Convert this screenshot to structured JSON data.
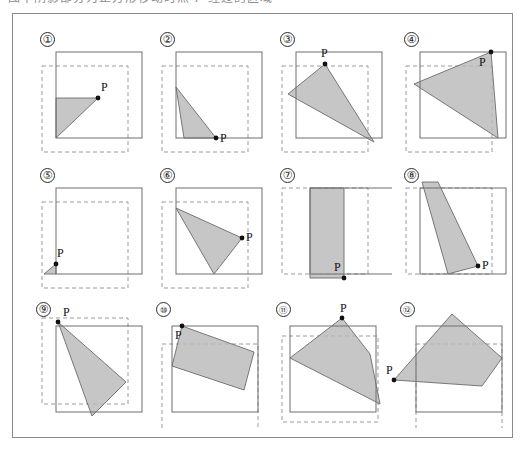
{
  "figure": {
    "caption_top": "图中阴影部分为正方形移动时点 P 经过的区域",
    "point_label": "P",
    "colors": {
      "plate_border": "#8a8a8a",
      "square_solid": "#6e6e6e",
      "square_dashed": "#9a9a9a",
      "shade_fill": "#b9b9b9",
      "shade_stroke": "#6b6b6b",
      "dot": "#111111",
      "label_text": "#111111"
    },
    "grid": {
      "rows": 3,
      "cols": 4,
      "count": 12
    }
  },
  "panels": [
    {
      "id": 1,
      "number": "①",
      "num_pos": [
        18,
        8
      ],
      "solid_square": [
        34,
        28,
        86,
        86
      ],
      "dashed_square": [
        20,
        42,
        86,
        86
      ],
      "shape_type": "triangle",
      "points": "34,74 76,74 34,114",
      "point_p": [
        76,
        74
      ],
      "p_label_pos": [
        79,
        57
      ]
    },
    {
      "id": 2,
      "number": "②",
      "num_pos": [
        18,
        8
      ],
      "solid_square": [
        34,
        28,
        86,
        86
      ],
      "dashed_square": [
        20,
        42,
        86,
        86
      ],
      "shape_type": "triangle",
      "points": "34,63 74,114 42,114",
      "point_p": [
        74,
        114
      ],
      "p_label_pos": [
        78,
        108
      ]
    },
    {
      "id": 3,
      "number": "③",
      "num_pos": [
        18,
        8
      ],
      "solid_square": [
        34,
        28,
        86,
        86
      ],
      "dashed_square": [
        20,
        42,
        86,
        86
      ],
      "shape_type": "triangle",
      "points": "63,40 26,70 112,118",
      "point_p": [
        63,
        40
      ],
      "p_label_pos": [
        59,
        23
      ]
    },
    {
      "id": 4,
      "number": "④",
      "num_pos": [
        18,
        8
      ],
      "solid_square": [
        34,
        28,
        86,
        86
      ],
      "dashed_square": [
        20,
        42,
        86,
        86
      ],
      "shape_type": "triangle",
      "points": "105,28 28,60 112,114",
      "point_p": [
        105,
        28
      ],
      "p_label_pos": [
        93,
        32
      ]
    },
    {
      "id": 5,
      "number": "⑤",
      "num_pos": [
        18,
        8
      ],
      "solid_square": [
        34,
        28,
        86,
        86
      ],
      "dashed_square": [
        20,
        42,
        86,
        86
      ],
      "shape_type": "triangle",
      "points": "34,104 34,114 22,114",
      "point_p": [
        34,
        104
      ],
      "p_label_pos": [
        35,
        87
      ]
    },
    {
      "id": 6,
      "number": "⑥",
      "num_pos": [
        18,
        8
      ],
      "solid_square": [
        34,
        28,
        86,
        86
      ],
      "dashed_square": [
        20,
        42,
        86,
        86
      ],
      "shape_type": "triangle",
      "points": "34,48 100,78 72,114",
      "point_p": [
        100,
        78
      ],
      "p_label_pos": [
        104,
        71
      ]
    },
    {
      "id": 7,
      "number": "⑦",
      "num_pos": [
        18,
        8
      ],
      "solid_square": [
        48,
        28,
        86,
        86
      ],
      "dashed_square": [
        20,
        28,
        86,
        86
      ],
      "shape_type": "band",
      "points": "48,28 82,28 82,118 48,118",
      "point_p": [
        82,
        118
      ],
      "p_label_pos": [
        72,
        101
      ]
    },
    {
      "id": 8,
      "number": "⑧",
      "num_pos": [
        18,
        8
      ],
      "solid_square": [
        34,
        28,
        86,
        86
      ],
      "dashed_square": [
        20,
        28,
        86,
        86
      ],
      "shape_type": "quad",
      "points": "36,22 52,22 92,106 62,114",
      "point_p": [
        92,
        106
      ],
      "p_label_pos": [
        96,
        99
      ]
    },
    {
      "id": 9,
      "number": "⑨",
      "num_pos": [
        14,
        6
      ],
      "solid_square": [
        34,
        30,
        86,
        86
      ],
      "dashed_square": [
        20,
        22,
        86,
        86
      ],
      "shape_type": "triangle",
      "points": "36,26 104,86 70,120",
      "point_p": [
        36,
        26
      ],
      "p_label_pos": [
        41,
        10
      ]
    },
    {
      "id": 10,
      "number": "⑩",
      "num_pos": [
        14,
        6
      ],
      "wide": true,
      "solid_square": [
        30,
        30,
        86,
        86
      ],
      "dashed_square": [
        20,
        48,
        96,
        86
      ],
      "shape_type": "quad",
      "points": "40,30 112,56 102,94 30,70",
      "point_p": [
        40,
        30
      ],
      "p_label_pos": [
        33,
        33
      ]
    },
    {
      "id": 11,
      "number": "⑪",
      "num_pos": [
        14,
        6
      ],
      "wide": true,
      "solid_square": [
        28,
        30,
        86,
        86
      ],
      "dashed_square": [
        20,
        40,
        96,
        86
      ],
      "shape_type": "quad",
      "points": "80,22 108,58 118,108 28,62",
      "point_p": [
        80,
        22
      ],
      "p_label_pos": [
        78,
        6
      ]
    },
    {
      "id": 12,
      "number": "⑫",
      "num_pos": [
        14,
        6
      ],
      "wide": true,
      "solid_square": [
        30,
        30,
        86,
        86
      ],
      "dashed_square": [
        30,
        48,
        86,
        86
      ],
      "shape_type": "quad",
      "points": "66,18 116,62 96,90 8,84",
      "point_p": [
        8,
        84
      ],
      "p_label_pos": [
        0,
        68
      ]
    }
  ],
  "layout": {
    "cell_origins": [
      [
        22,
        24
      ],
      [
        142,
        24
      ],
      [
        262,
        24
      ],
      [
        386,
        24
      ],
      [
        22,
        160
      ],
      [
        142,
        160
      ],
      [
        262,
        160
      ],
      [
        386,
        160
      ],
      [
        22,
        296
      ],
      [
        142,
        296
      ],
      [
        262,
        296
      ],
      [
        386,
        296
      ]
    ],
    "cell_size": [
      130,
      132
    ]
  }
}
